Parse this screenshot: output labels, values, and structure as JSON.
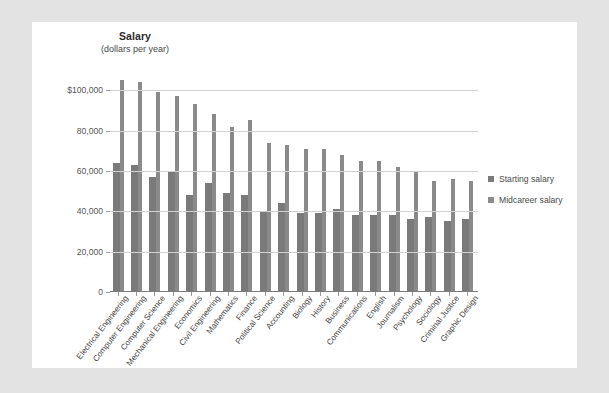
{
  "chart_data": {
    "type": "bar",
    "title": "Salary",
    "subtitle": "(dollars per year)",
    "xlabel": "",
    "ylabel": "Salary (dollars per year)",
    "ylim": [
      0,
      110000
    ],
    "yticks": [
      0,
      20000,
      40000,
      60000,
      80000,
      100000
    ],
    "ytick_labels": [
      "0",
      "20,000",
      "40,000",
      "60,000",
      "80,000",
      "$100,000"
    ],
    "grid": true,
    "legend_position": "right",
    "categories": [
      "Electrical Engineering",
      "Computer Engineering",
      "Computer Science",
      "Mechanical Engineering",
      "Economics",
      "Civil Engineering",
      "Mathematics",
      "Finance",
      "Political Science",
      "Accounting",
      "Biology",
      "History",
      "Business",
      "Communications",
      "English",
      "Journalism",
      "Psychology",
      "Sociology",
      "Criminal Justice",
      "Graphic Design"
    ],
    "series": [
      {
        "name": "Starting salary",
        "color": "#7a7a7a",
        "values": [
          64000,
          63000,
          57000,
          60000,
          48000,
          54000,
          49000,
          48000,
          40000,
          44000,
          39000,
          39000,
          41000,
          38000,
          38000,
          38000,
          36000,
          37000,
          35000,
          36000
        ]
      },
      {
        "name": "Midcareer salary",
        "color": "#8a8a8a",
        "values": [
          105000,
          104000,
          99000,
          97000,
          93000,
          88000,
          82000,
          85000,
          74000,
          73000,
          71000,
          71000,
          68000,
          65000,
          65000,
          62000,
          60000,
          55000,
          56000,
          55000
        ]
      }
    ],
    "legend": [
      "Starting salary",
      "Midcareer salary"
    ]
  },
  "colors": {
    "page_background": "#e3e3e3",
    "card_background": "#ffffff",
    "gridline": "#d2d2d2",
    "axis": "#7c7c7c",
    "starting_salary": "#7a7a7a",
    "midcareer_salary": "#8a8a8a",
    "tick_text": "#555555",
    "label_text": "#3f3f3f"
  }
}
